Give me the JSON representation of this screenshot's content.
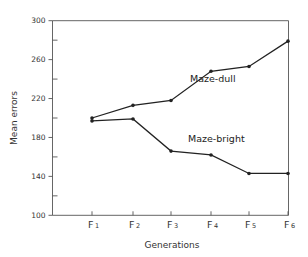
{
  "chart_data": {
    "type": "line",
    "title": "",
    "xlabel": "Generations",
    "ylabel": "Mean errors",
    "categories": [
      "F1",
      "F2",
      "F3",
      "F4",
      "F5",
      "F6"
    ],
    "category_labels": [
      {
        "main": "F",
        "sub": "1"
      },
      {
        "main": "F",
        "sub": "2"
      },
      {
        "main": "F",
        "sub": "3"
      },
      {
        "main": "F",
        "sub": "4"
      },
      {
        "main": "F",
        "sub": "5"
      },
      {
        "main": "F",
        "sub": "6"
      }
    ],
    "series": [
      {
        "name": "Maze-dull",
        "values": [
          200,
          213,
          218,
          248,
          253,
          279
        ]
      },
      {
        "name": "Maze-bright",
        "values": [
          197,
          199,
          166,
          162,
          143,
          143
        ]
      }
    ],
    "ylim": [
      100,
      300
    ],
    "yticks_major": [
      100,
      140,
      180,
      220,
      260,
      300
    ],
    "yticks_minor": [
      120,
      160,
      200,
      240,
      280
    ],
    "grid": false,
    "legend": "inline labels",
    "line_color": "#222222"
  }
}
